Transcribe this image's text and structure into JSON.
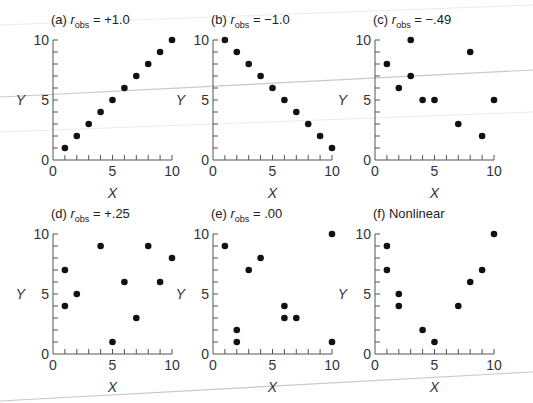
{
  "figure": {
    "x_axis_label": "X",
    "y_axis_label": "Y",
    "tick_labels": [
      "0",
      "5",
      "10"
    ]
  },
  "chart_data": [
    {
      "type": "scatter",
      "panel": "(a)",
      "title": "(a) r_obs = +1.0",
      "title_prefix": "(a)",
      "title_r": "r",
      "title_sub": "obs",
      "title_value": " = +1.0",
      "xlabel": "X",
      "ylabel": "Y",
      "xlim": [
        0,
        10
      ],
      "ylim": [
        0,
        10
      ],
      "xticks": [
        0,
        5,
        10
      ],
      "yticks": [
        0,
        5,
        10
      ],
      "grid": false,
      "points": [
        [
          1,
          1
        ],
        [
          2,
          2
        ],
        [
          3,
          3
        ],
        [
          4,
          4
        ],
        [
          5,
          5
        ],
        [
          6,
          6
        ],
        [
          7,
          7
        ],
        [
          8,
          8
        ],
        [
          9,
          9
        ],
        [
          10,
          10
        ]
      ]
    },
    {
      "type": "scatter",
      "panel": "(b)",
      "title": "(b) r_obs = −1.0",
      "title_prefix": "(b)",
      "title_r": "r",
      "title_sub": "obs",
      "title_value": " = −1.0",
      "xlabel": "X",
      "ylabel": "Y",
      "xlim": [
        0,
        10
      ],
      "ylim": [
        0,
        10
      ],
      "xticks": [
        0,
        5,
        10
      ],
      "yticks": [
        0,
        5,
        10
      ],
      "grid": false,
      "points": [
        [
          1,
          10
        ],
        [
          2,
          9
        ],
        [
          3,
          8
        ],
        [
          4,
          7
        ],
        [
          5,
          6
        ],
        [
          6,
          5
        ],
        [
          7,
          4
        ],
        [
          8,
          3
        ],
        [
          9,
          2
        ],
        [
          10,
          1
        ]
      ]
    },
    {
      "type": "scatter",
      "panel": "(c)",
      "title": "(c) r_obs = −.49",
      "title_prefix": "(c)",
      "title_r": "r",
      "title_sub": "obs",
      "title_value": " = −.49",
      "xlabel": "X",
      "ylabel": "Y",
      "xlim": [
        0,
        10
      ],
      "ylim": [
        0,
        10
      ],
      "xticks": [
        0,
        5,
        10
      ],
      "yticks": [
        0,
        5,
        10
      ],
      "grid": false,
      "points": [
        [
          1,
          8
        ],
        [
          2,
          6
        ],
        [
          3,
          10
        ],
        [
          3,
          7
        ],
        [
          4,
          5
        ],
        [
          5,
          5
        ],
        [
          7,
          3
        ],
        [
          8,
          9
        ],
        [
          9,
          2
        ],
        [
          10,
          5
        ]
      ]
    },
    {
      "type": "scatter",
      "panel": "(d)",
      "title": "(d) r_obs = +.25",
      "title_prefix": "(d)",
      "title_r": "r",
      "title_sub": "obs",
      "title_value": " = +.25",
      "xlabel": "X",
      "ylabel": "Y",
      "xlim": [
        0,
        10
      ],
      "ylim": [
        0,
        10
      ],
      "xticks": [
        0,
        5,
        10
      ],
      "yticks": [
        0,
        5,
        10
      ],
      "grid": false,
      "points": [
        [
          1,
          7
        ],
        [
          1,
          4
        ],
        [
          2,
          5
        ],
        [
          4,
          9
        ],
        [
          5,
          1
        ],
        [
          6,
          6
        ],
        [
          7,
          3
        ],
        [
          8,
          9
        ],
        [
          9,
          6
        ],
        [
          10,
          8
        ]
      ]
    },
    {
      "type": "scatter",
      "panel": "(e)",
      "title": "(e) r_obs = .00",
      "title_prefix": "(e)",
      "title_r": "r",
      "title_sub": "obs",
      "title_value": " = .00",
      "xlabel": "X",
      "ylabel": "Y",
      "xlim": [
        0,
        10
      ],
      "ylim": [
        0,
        10
      ],
      "xticks": [
        0,
        5,
        10
      ],
      "yticks": [
        0,
        5,
        10
      ],
      "grid": false,
      "points": [
        [
          1,
          9
        ],
        [
          2,
          2
        ],
        [
          2,
          1
        ],
        [
          3,
          7
        ],
        [
          4,
          8
        ],
        [
          6,
          4
        ],
        [
          6,
          3
        ],
        [
          7,
          3
        ],
        [
          10,
          10
        ],
        [
          10,
          1
        ]
      ]
    },
    {
      "type": "scatter",
      "panel": "(f)",
      "title": "(f) Nonlinear",
      "title_prefix": "(f)",
      "title_r": "",
      "title_sub": "",
      "title_value": "Nonlinear",
      "xlabel": "X",
      "ylabel": "Y",
      "xlim": [
        0,
        10
      ],
      "ylim": [
        0,
        10
      ],
      "xticks": [
        0,
        5,
        10
      ],
      "yticks": [
        0,
        5,
        10
      ],
      "grid": false,
      "points": [
        [
          1,
          9
        ],
        [
          1,
          7
        ],
        [
          2,
          5
        ],
        [
          2,
          4
        ],
        [
          4,
          2
        ],
        [
          5,
          1
        ],
        [
          7,
          4
        ],
        [
          8,
          6
        ],
        [
          9,
          7
        ],
        [
          10,
          10
        ]
      ]
    }
  ]
}
